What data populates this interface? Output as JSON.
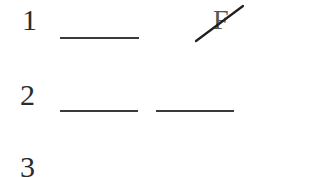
{
  "rows": [
    {
      "number": "1",
      "blanks": 1,
      "crossed_letter": "F"
    },
    {
      "number": "2",
      "blanks": 2
    },
    {
      "number": "3",
      "blanks": 0
    }
  ],
  "colors": {
    "text": "#2b2b2b",
    "line": "#3a3a3a",
    "crossed_letter": "#555555",
    "background": "#ffffff"
  }
}
